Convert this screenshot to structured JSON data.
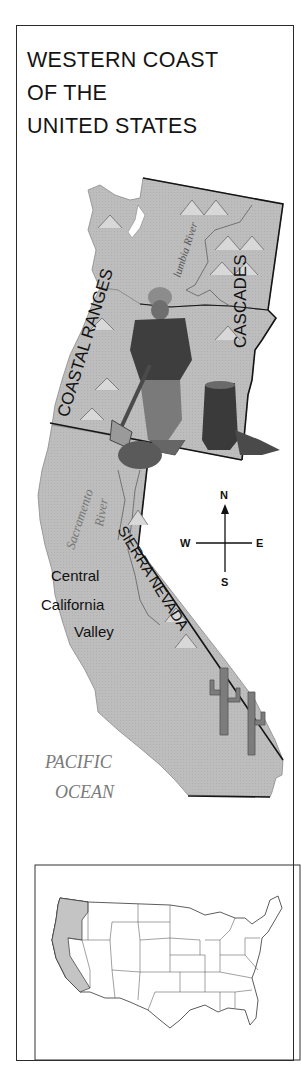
{
  "title": {
    "line1": "WESTERN COAST",
    "line2": "OF THE",
    "line3": "UNITED STATES"
  },
  "map": {
    "mountain_ranges": [
      "COASTAL RANGES",
      "CASCADES",
      "SIERRA NEVADA"
    ],
    "rivers": [
      {
        "label_line1": "Columbia",
        "label_line2": "River",
        "visible_text": "lumbia River"
      },
      {
        "label_line1": "Sacramento",
        "label_line2": "River"
      }
    ],
    "regions": {
      "valley_line1": "Central",
      "valley_line2": "California",
      "valley_line3": "Valley"
    },
    "ocean": {
      "line1": "PACIFIC",
      "line2": "OCEAN"
    },
    "compass": {
      "north": "N",
      "south": "S",
      "east": "E",
      "west": "W"
    },
    "illustrations": [
      "lumberjack-with-axe",
      "tree-stump",
      "mountains",
      "saguaro-cacti"
    ],
    "colors": {
      "land": "#b9b9b9",
      "land_shadow": "#9a9a9a",
      "border_line": "#1a1a1a",
      "ocean_label": "#7a7a7a",
      "highlight_states": "#c4c4c4"
    }
  },
  "inset_map": {
    "description": "Contiguous United States outline",
    "highlighted_states": [
      "Washington",
      "Oregon",
      "California"
    ]
  }
}
